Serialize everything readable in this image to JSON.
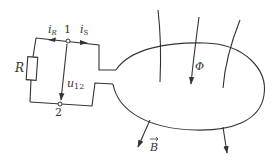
{
  "diagram": {
    "type": "circuit-with-flux-loop",
    "labels": {
      "current_R": "i",
      "current_R_sub": "R",
      "current_S": "i",
      "current_S_sub": "S",
      "node1": "1",
      "node2": "2",
      "resistor": "R",
      "voltage": "u",
      "voltage_sub": "12",
      "flux": "Φ",
      "field": "B",
      "field_vector_mark": "→"
    },
    "colors": {
      "stroke": "#333333",
      "background": "#ffffff"
    }
  }
}
